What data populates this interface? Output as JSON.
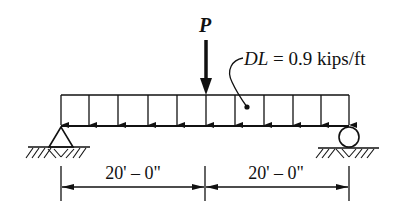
{
  "diagram": {
    "point_load": {
      "label": "P",
      "position": "midspan"
    },
    "distributed_load": {
      "symbol": "DL",
      "equals": " = 0.9 kips/ft",
      "value": 0.9,
      "unit": "kips/ft",
      "arrow_count": 11
    },
    "supports": {
      "left": {
        "type": "pin"
      },
      "right": {
        "type": "roller"
      }
    },
    "dimensions": [
      {
        "label": "20' – 0\"",
        "feet": 20,
        "inches": 0
      },
      {
        "label": "20' – 0\"",
        "feet": 20,
        "inches": 0
      }
    ],
    "colors": {
      "line": "#111111",
      "background": "#ffffff"
    }
  }
}
